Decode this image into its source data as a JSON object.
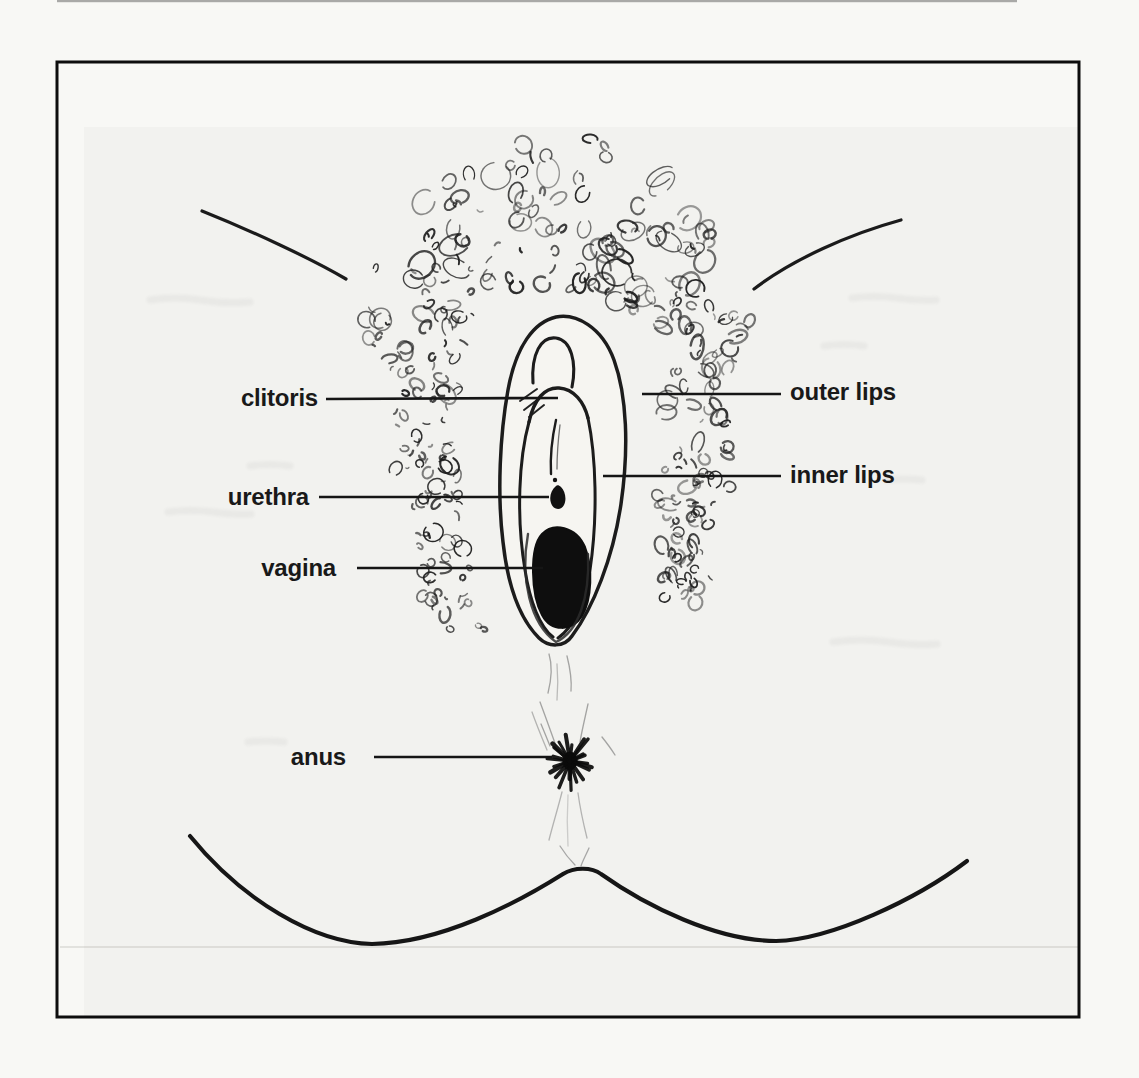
{
  "figure": {
    "alt": "Hand-drawn black-and-white line diagram of the vulva (external female genitals), front view, on a scanned book page framed by a thin black border",
    "colors": {
      "ink": "#1a1a1a",
      "frame": "#0d0d0d",
      "paper": "#f6f5f1",
      "page": "#f8f8f5",
      "label_text": "#191919",
      "leader_line": "#151515"
    }
  },
  "labels": [
    {
      "id": "clitoris",
      "text": "clitoris",
      "side": "left",
      "tx": 318,
      "y": 399,
      "line": {
        "x1": 326,
        "y1": 399,
        "x2": 558,
        "y2": 398
      }
    },
    {
      "id": "urethra",
      "text": "urethra",
      "side": "left",
      "tx": 309,
      "y": 498,
      "line": {
        "x1": 319,
        "y1": 497,
        "x2": 549,
        "y2": 497
      }
    },
    {
      "id": "vagina",
      "text": "vagina",
      "side": "left",
      "tx": 336,
      "y": 569,
      "line": {
        "x1": 357,
        "y1": 568,
        "x2": 543,
        "y2": 568
      }
    },
    {
      "id": "anus",
      "text": "anus",
      "side": "left",
      "tx": 346,
      "y": 758,
      "line": {
        "x1": 374,
        "y1": 757,
        "x2": 552,
        "y2": 757
      }
    },
    {
      "id": "outer-lips",
      "text": "outer lips",
      "side": "right",
      "tx": 790,
      "y": 393,
      "line": {
        "x1": 642,
        "y1": 394,
        "x2": 781,
        "y2": 394
      }
    },
    {
      "id": "inner-lips",
      "text": "inner lips",
      "side": "right",
      "tx": 790,
      "y": 476,
      "line": {
        "x1": 603,
        "y1": 476,
        "x2": 781,
        "y2": 476
      }
    }
  ]
}
